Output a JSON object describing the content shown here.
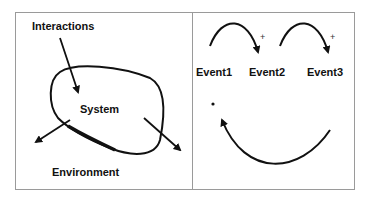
{
  "left_panel": {
    "labels": {
      "interactions": "Interactions",
      "system": "System",
      "environment": "Environment"
    }
  },
  "right_panel": {
    "events": [
      "Event1",
      "Event2",
      "Event3"
    ],
    "plus_marks": [
      "+",
      "+"
    ],
    "dot": "·"
  },
  "colors": {
    "stroke": "#111111",
    "border": "#9a9a9a",
    "background": "#ffffff"
  }
}
